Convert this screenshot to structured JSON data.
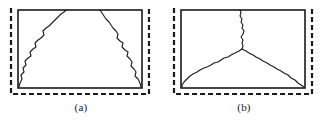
{
  "figure": {
    "background_color": "#ffffff",
    "stroke_color": "#1a1a1a",
    "panels": [
      {
        "id": "a",
        "caption": "(a)",
        "description": "Specimen with two inclined jagged cracks forming a trapezoidal cone failure pattern",
        "specimen_rect": {
          "x": 18,
          "y": 10,
          "width": 124,
          "height": 78
        },
        "dashed_outline": {
          "left_x": 11,
          "right_x": 149,
          "bottom_y": 94,
          "top_y": 8,
          "dash_pattern": "5,3",
          "stroke_width": 2.2
        },
        "cracks": [
          {
            "name": "left-crack",
            "points": "19,87 20,83 22,79 21,75 24,72 23,68 26,65 25,61 28,58 31,56 30,52 33,49 36,47 35,43 38,40 41,38 44,35 43,31 46,28 49,26 52,23 55,20 58,17 61,14 64,12 66,10"
          },
          {
            "name": "right-crack",
            "points": "100,10 102,13 104,16 106,19 109,22 111,25 113,28 116,31 118,34 117,38 120,41 123,43 122,47 125,50 128,52 127,56 130,59 132,62 131,66 134,69 136,72 135,76 138,79 140,83 141,87"
          }
        ]
      },
      {
        "id": "b",
        "caption": "(b)",
        "description": "Specimen with a Y-shaped crack: a vertical crack from the top meeting two inclined cracks at a central junction",
        "specimen_rect": {
          "x": 18,
          "y": 10,
          "width": 124,
          "height": 78
        },
        "dashed_outline": {
          "left_x": 11,
          "right_x": 149,
          "bottom_y": 94,
          "top_y": 8,
          "dash_pattern": "5,3",
          "stroke_width": 2.2
        },
        "cracks": [
          {
            "name": "vertical-crack",
            "points": "77,10 78,13 77,16 79,19 78,22 80,25 79,28 81,31 80,34 78,37 80,40 79,43 80,46 79,49"
          },
          {
            "name": "left-branch-crack",
            "points": "79,49 76,51 72,53 68,55 65,57 61,58 58,60 55,62 51,63 48,65 44,67 41,68 37,70 34,72 30,74 27,76 24,79 21,82 19,85 19,87"
          },
          {
            "name": "right-branch-crack",
            "points": "79,49 83,51 86,53 90,55 93,57 97,59 100,61 104,63 107,65 111,67 114,69 118,71 121,73 125,75 128,78 132,80 135,83 138,85 141,87"
          }
        ]
      }
    ]
  }
}
